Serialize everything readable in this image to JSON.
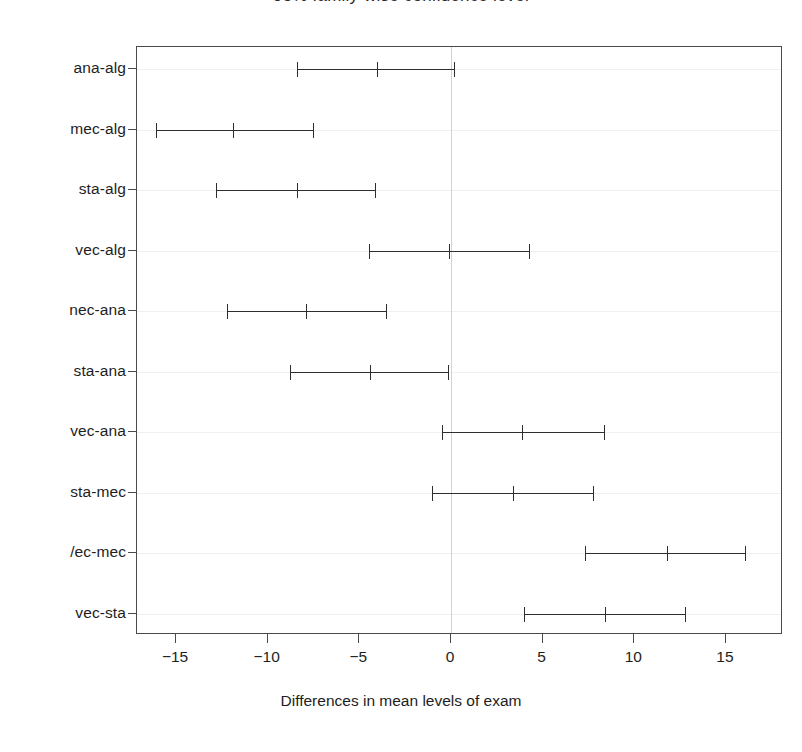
{
  "chart_data": {
    "type": "scatter",
    "title": "95% family-wise confidence level",
    "title_truncated": true,
    "xlabel": "Differences in mean levels of exam",
    "ylabel": "",
    "xlim": [
      -17.7,
      17.7
    ],
    "xticks": [
      -15,
      -10,
      -5,
      0,
      5,
      10,
      15
    ],
    "xticklabels": [
      "-15",
      "-10",
      "-5",
      "0",
      "5",
      "10",
      "15"
    ],
    "grid": false,
    "reference_line_x": 0,
    "legend": "none",
    "categories": [
      "ana-alg",
      "mec-alg",
      "sta-alg",
      "vec-alg",
      "mec-ana",
      "sta-ana",
      "vec-ana",
      "sta-mec",
      "vec-mec",
      "vec-sta"
    ],
    "category_labels_rendered": [
      "ana-alg",
      "mec-alg",
      "sta-alg",
      "vec-alg",
      "nec-ana",
      "sta-ana",
      "vec-ana",
      "sta-mec",
      "/ec-mec",
      "vec-sta"
    ],
    "series": [
      {
        "name": "difference in means",
        "values": [
          -4.05,
          -11.9,
          -8.4,
          -0.1,
          -7.9,
          -4.4,
          3.9,
          3.4,
          11.8,
          8.4
        ]
      },
      {
        "name": "lower confidence limit",
        "values": [
          -8.4,
          -16.1,
          -12.8,
          -4.5,
          -12.2,
          -8.8,
          -0.5,
          -1.05,
          7.3,
          4.0
        ]
      },
      {
        "name": "upper confidence limit",
        "values": [
          0.2,
          -7.5,
          -4.1,
          4.3,
          -3.5,
          -0.1,
          8.4,
          7.8,
          16.1,
          12.8
        ]
      }
    ],
    "intervals": [
      {
        "label": "ana-alg",
        "lower": -8.4,
        "center": -4.05,
        "upper": 0.2
      },
      {
        "label": "mec-alg",
        "lower": -16.1,
        "center": -11.9,
        "upper": -7.5
      },
      {
        "label": "sta-alg",
        "lower": -12.8,
        "center": -8.4,
        "upper": -4.1
      },
      {
        "label": "vec-alg",
        "lower": -4.5,
        "center": -0.1,
        "upper": 4.3
      },
      {
        "label": "mec-ana",
        "lower": -12.2,
        "center": -7.9,
        "upper": -3.5
      },
      {
        "label": "sta-ana",
        "lower": -8.8,
        "center": -4.4,
        "upper": -0.1
      },
      {
        "label": "vec-ana",
        "lower": -0.5,
        "center": 3.9,
        "upper": 8.4
      },
      {
        "label": "sta-mec",
        "lower": -1.05,
        "center": 3.4,
        "upper": 7.8
      },
      {
        "label": "vec-mec",
        "lower": 7.3,
        "center": 11.8,
        "upper": 16.1
      },
      {
        "label": "vec-sta",
        "lower": 4.0,
        "center": 8.4,
        "upper": 12.8
      }
    ],
    "colors": {
      "line": "#2e2e2e",
      "frame": "#4a4a4a",
      "reference": "#d2d2d2",
      "grid": "#f0f0f0",
      "background": "#ffffff"
    }
  }
}
